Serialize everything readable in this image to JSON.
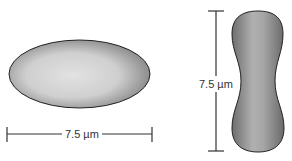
{
  "diagram": {
    "top_view": {
      "shape": "ellipse",
      "dimension_label": "7.5 µm",
      "orientation": "horizontal"
    },
    "side_view": {
      "shape": "biconcave dumbbell",
      "dimension_label": "7.5 µm",
      "orientation": "vertical"
    },
    "colors": {
      "cell_light": "#dcdcdc",
      "cell_dark": "#7a7a7a",
      "outline": "#222222",
      "scale_bar": "#333333"
    }
  }
}
